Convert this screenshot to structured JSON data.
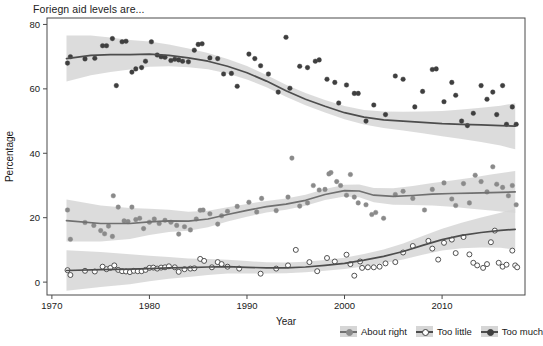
{
  "chart_data": {
    "type": "scatter",
    "title": "Foriegn aid levels are...",
    "xlabel": "Year",
    "ylabel": "Percentage",
    "xlim": [
      1969.5,
      2018.5
    ],
    "ylim": [
      -4,
      82
    ],
    "xticks": [
      1970,
      1980,
      1990,
      2000,
      2010
    ],
    "yticks": [
      0,
      20,
      40,
      60,
      80
    ],
    "grid": false,
    "legend_position": "bottom-right",
    "smoother": "loess with shaded confidence ribbon",
    "colors": {
      "too_much_line": "#4d4d4d",
      "too_much_point": "#3f3f3f",
      "about_right_line": "#707070",
      "about_right_point": "#8a8a8a",
      "too_little_line": "#4d4d4d",
      "too_little_point": "#ffffff",
      "too_little_point_edge": "#3f3f3f",
      "ribbon": "#d6d6d6",
      "axis": "#4a4a4a",
      "background": "#ffffff"
    },
    "series": [
      {
        "name": "About right",
        "marker": "filled-circle-grey",
        "points": [
          [
            1971.6,
            22.4
          ],
          [
            1971.9,
            13.3
          ],
          [
            1973.4,
            18.5
          ],
          [
            1974.3,
            17.6
          ],
          [
            1975.0,
            16.0
          ],
          [
            1975.4,
            15.0
          ],
          [
            1975.8,
            17.4
          ],
          [
            1976.2,
            14.2
          ],
          [
            1976.3,
            26.8
          ],
          [
            1976.8,
            23.3
          ],
          [
            1977.4,
            19.0
          ],
          [
            1977.8,
            18.8
          ],
          [
            1978.2,
            23.3
          ],
          [
            1978.6,
            19.4
          ],
          [
            1979.0,
            19.8
          ],
          [
            1979.4,
            16.6
          ],
          [
            1980.0,
            18.6
          ],
          [
            1980.5,
            19.6
          ],
          [
            1981.0,
            18.2
          ],
          [
            1981.6,
            19.2
          ],
          [
            1982.2,
            18.6
          ],
          [
            1982.8,
            17.6
          ],
          [
            1983.0,
            14.9
          ],
          [
            1983.6,
            17.2
          ],
          [
            1984.2,
            16.2
          ],
          [
            1984.8,
            19.6
          ],
          [
            1985.2,
            22.3
          ],
          [
            1985.5,
            22.4
          ],
          [
            1986.2,
            21.2
          ],
          [
            1987.0,
            18.0
          ],
          [
            1987.4,
            20.6
          ],
          [
            1988.0,
            22.0
          ],
          [
            1989.0,
            23.5
          ],
          [
            1990.2,
            24.8
          ],
          [
            1991.0,
            21.8
          ],
          [
            1991.5,
            26.0
          ],
          [
            1993.0,
            22.2
          ],
          [
            1994.2,
            26.4
          ],
          [
            1994.6,
            38.5
          ],
          [
            1995.4,
            23.6
          ],
          [
            1996.2,
            24.6
          ],
          [
            1996.8,
            30.0
          ],
          [
            1997.4,
            28.6
          ],
          [
            1998.0,
            28.8
          ],
          [
            1998.4,
            33.6
          ],
          [
            1998.6,
            34.0
          ],
          [
            1999.2,
            31.2
          ],
          [
            1999.6,
            30.0
          ],
          [
            2000.2,
            27.0
          ],
          [
            2000.6,
            33.4
          ],
          [
            2001.0,
            26.4
          ],
          [
            2001.4,
            24.6
          ],
          [
            2002.2,
            24.0
          ],
          [
            2002.8,
            21.0
          ],
          [
            2003.2,
            21.6
          ],
          [
            2004.0,
            19.8
          ],
          [
            2005.2,
            27.2
          ],
          [
            2006.0,
            28.2
          ],
          [
            2007.0,
            26.0
          ],
          [
            2008.2,
            22.4
          ],
          [
            2009.0,
            28.8
          ],
          [
            2010.2,
            30.8
          ],
          [
            2011.0,
            25.8
          ],
          [
            2011.4,
            23.8
          ],
          [
            2012.2,
            30.6
          ],
          [
            2012.8,
            24.6
          ],
          [
            2013.4,
            33.2
          ],
          [
            2014.0,
            31.2
          ],
          [
            2014.6,
            28.0
          ],
          [
            2015.2,
            35.8
          ],
          [
            2015.6,
            30.4
          ],
          [
            2016.2,
            29.4
          ],
          [
            2016.8,
            26.8
          ],
          [
            2017.2,
            30.0
          ],
          [
            2017.6,
            24.0
          ]
        ],
        "fit": [
          [
            1971.5,
            19.1
          ],
          [
            1975,
            18.2
          ],
          [
            1978,
            18.2
          ],
          [
            1980,
            18.7
          ],
          [
            1982,
            19.0
          ],
          [
            1984,
            18.9
          ],
          [
            1986,
            19.6
          ],
          [
            1988,
            21.0
          ],
          [
            1990,
            22.3
          ],
          [
            1992,
            23.4
          ],
          [
            1994,
            24.2
          ],
          [
            1996,
            25.4
          ],
          [
            1998,
            27.2
          ],
          [
            2000,
            28.4
          ],
          [
            2001.5,
            28.3
          ],
          [
            2003,
            27.0
          ],
          [
            2005,
            26.6
          ],
          [
            2007,
            26.9
          ],
          [
            2009,
            27.3
          ],
          [
            2011,
            27.5
          ],
          [
            2013,
            27.6
          ],
          [
            2015,
            27.8
          ],
          [
            2017.5,
            28.0
          ]
        ]
      },
      {
        "name": "Too little",
        "marker": "open-circle",
        "points": [
          [
            1971.6,
            3.7
          ],
          [
            1971.9,
            2.2
          ],
          [
            1973.4,
            3.5
          ],
          [
            1974.4,
            3.3
          ],
          [
            1975.2,
            4.8
          ],
          [
            1975.6,
            4.0
          ],
          [
            1976.0,
            4.4
          ],
          [
            1976.4,
            5.2
          ],
          [
            1976.8,
            3.8
          ],
          [
            1977.2,
            3.4
          ],
          [
            1977.6,
            3.3
          ],
          [
            1978.0,
            3.1
          ],
          [
            1978.4,
            3.5
          ],
          [
            1978.8,
            3.4
          ],
          [
            1979.2,
            3.4
          ],
          [
            1979.6,
            3.8
          ],
          [
            1980.0,
            4.4
          ],
          [
            1980.4,
            4.5
          ],
          [
            1980.8,
            4.2
          ],
          [
            1981.2,
            4.5
          ],
          [
            1981.6,
            4.6
          ],
          [
            1982.0,
            4.9
          ],
          [
            1982.6,
            4.6
          ],
          [
            1983.0,
            3.2
          ],
          [
            1983.6,
            4.0
          ],
          [
            1984.2,
            4.2
          ],
          [
            1984.6,
            4.3
          ],
          [
            1985.2,
            7.2
          ],
          [
            1985.6,
            6.6
          ],
          [
            1986.4,
            4.6
          ],
          [
            1987.0,
            6.2
          ],
          [
            1987.4,
            5.6
          ],
          [
            1988.0,
            4.8
          ],
          [
            1989.2,
            4.2
          ],
          [
            1991.4,
            2.6
          ],
          [
            1993.0,
            4.2
          ],
          [
            1994.2,
            5.2
          ],
          [
            1995.0,
            10.0
          ],
          [
            1996.4,
            6.2
          ],
          [
            1997.2,
            3.4
          ],
          [
            1998.2,
            7.5
          ],
          [
            1999.0,
            6.4
          ],
          [
            2000.2,
            8.5
          ],
          [
            2000.6,
            5.6
          ],
          [
            2001.0,
            2.0
          ],
          [
            2001.6,
            6.4
          ],
          [
            2001.8,
            4.4
          ],
          [
            2002.4,
            4.6
          ],
          [
            2003.0,
            4.6
          ],
          [
            2003.6,
            4.8
          ],
          [
            2004.2,
            5.8
          ],
          [
            2005.2,
            6.2
          ],
          [
            2006.0,
            9.2
          ],
          [
            2007.0,
            11.2
          ],
          [
            2008.6,
            12.8
          ],
          [
            2009.0,
            10.4
          ],
          [
            2009.6,
            7.0
          ],
          [
            2010.2,
            12.2
          ],
          [
            2011.0,
            13.2
          ],
          [
            2011.4,
            9.0
          ],
          [
            2012.2,
            14.0
          ],
          [
            2012.8,
            8.6
          ],
          [
            2013.2,
            6.0
          ],
          [
            2013.6,
            5.2
          ],
          [
            2014.2,
            4.4
          ],
          [
            2014.6,
            5.6
          ],
          [
            2015.0,
            12.4
          ],
          [
            2015.4,
            16.0
          ],
          [
            2015.8,
            6.0
          ],
          [
            2016.2,
            4.8
          ],
          [
            2016.6,
            5.4
          ],
          [
            2017.2,
            9.8
          ],
          [
            2017.5,
            5.2
          ],
          [
            2017.7,
            4.6
          ]
        ],
        "fit": [
          [
            1971.5,
            3.6
          ],
          [
            1975,
            3.9
          ],
          [
            1978,
            4.0
          ],
          [
            1980,
            4.2
          ],
          [
            1982,
            4.4
          ],
          [
            1984,
            4.5
          ],
          [
            1986,
            4.7
          ],
          [
            1988,
            4.8
          ],
          [
            1990,
            4.6
          ],
          [
            1992,
            4.4
          ],
          [
            1994,
            4.4
          ],
          [
            1996,
            4.7
          ],
          [
            1998,
            5.2
          ],
          [
            2000,
            5.8
          ],
          [
            2002,
            6.8
          ],
          [
            2004,
            8.0
          ],
          [
            2006,
            9.5
          ],
          [
            2008,
            11.4
          ],
          [
            2010,
            13.2
          ],
          [
            2012,
            14.5
          ],
          [
            2014,
            15.4
          ],
          [
            2016,
            16.1
          ],
          [
            2017.5,
            16.4
          ]
        ]
      },
      {
        "name": "Too much",
        "marker": "filled-circle-dark",
        "points": [
          [
            1971.6,
            68.0
          ],
          [
            1971.9,
            70.0
          ],
          [
            1973.4,
            69.3
          ],
          [
            1974.4,
            69.5
          ],
          [
            1975.2,
            73.4
          ],
          [
            1975.6,
            73.4
          ],
          [
            1976.2,
            75.6
          ],
          [
            1976.6,
            61.0
          ],
          [
            1977.2,
            74.6
          ],
          [
            1977.6,
            74.8
          ],
          [
            1978.2,
            65.2
          ],
          [
            1978.6,
            66.2
          ],
          [
            1979.2,
            66.6
          ],
          [
            1979.6,
            68.6
          ],
          [
            1980.2,
            74.6
          ],
          [
            1980.8,
            70.5
          ],
          [
            1981.2,
            70.0
          ],
          [
            1981.6,
            69.8
          ],
          [
            1982.2,
            68.8
          ],
          [
            1982.6,
            69.2
          ],
          [
            1983.0,
            69.0
          ],
          [
            1983.4,
            68.6
          ],
          [
            1984.0,
            68.4
          ],
          [
            1984.6,
            72.0
          ],
          [
            1985.0,
            73.8
          ],
          [
            1985.4,
            74.0
          ],
          [
            1986.2,
            69.6
          ],
          [
            1987.0,
            69.4
          ],
          [
            1987.6,
            64.6
          ],
          [
            1988.4,
            64.8
          ],
          [
            1989.0,
            60.8
          ],
          [
            1990.2,
            70.8
          ],
          [
            1990.8,
            69.4
          ],
          [
            1991.4,
            67.2
          ],
          [
            1992.2,
            64.6
          ],
          [
            1993.2,
            59.0
          ],
          [
            1994.0,
            76.0
          ],
          [
            1994.4,
            60.2
          ],
          [
            1995.4,
            67.0
          ],
          [
            1996.2,
            66.6
          ],
          [
            1997.0,
            68.6
          ],
          [
            1997.4,
            69.0
          ],
          [
            1998.2,
            63.0
          ],
          [
            1999.0,
            62.0
          ],
          [
            1999.4,
            55.6
          ],
          [
            2000.2,
            61.2
          ],
          [
            2001.0,
            58.6
          ],
          [
            2001.4,
            58.6
          ],
          [
            2002.2,
            50.0
          ],
          [
            2003.0,
            55.0
          ],
          [
            2004.2,
            52.0
          ],
          [
            2005.2,
            64.0
          ],
          [
            2006.0,
            63.0
          ],
          [
            2007.2,
            54.4
          ],
          [
            2008.0,
            59.2
          ],
          [
            2009.0,
            66.0
          ],
          [
            2009.4,
            66.2
          ],
          [
            2010.2,
            56.0
          ],
          [
            2011.0,
            62.0
          ],
          [
            2011.4,
            58.0
          ],
          [
            2012.0,
            50.0
          ],
          [
            2012.6,
            48.6
          ],
          [
            2013.2,
            52.4
          ],
          [
            2014.0,
            61.0
          ],
          [
            2014.6,
            56.8
          ],
          [
            2015.2,
            59.0
          ],
          [
            2015.6,
            52.0
          ],
          [
            2016.2,
            61.0
          ],
          [
            2016.6,
            49.0
          ],
          [
            2017.2,
            54.4
          ],
          [
            2017.6,
            49.0
          ]
        ],
        "fit": [
          [
            1971.5,
            69.4
          ],
          [
            1974,
            70.4
          ],
          [
            1976,
            70.6
          ],
          [
            1978,
            70.6
          ],
          [
            1980,
            70.8
          ],
          [
            1982,
            70.4
          ],
          [
            1984,
            69.6
          ],
          [
            1986,
            68.6
          ],
          [
            1988,
            67.0
          ],
          [
            1990,
            65.0
          ],
          [
            1992,
            62.4
          ],
          [
            1994,
            59.4
          ],
          [
            1996,
            56.8
          ],
          [
            1998,
            54.6
          ],
          [
            2000,
            52.6
          ],
          [
            2002,
            51.2
          ],
          [
            2004,
            50.4
          ],
          [
            2006,
            50.0
          ],
          [
            2008,
            49.6
          ],
          [
            2010,
            49.2
          ],
          [
            2012,
            49.0
          ],
          [
            2014,
            48.8
          ],
          [
            2016,
            48.6
          ],
          [
            2017.5,
            48.4
          ]
        ]
      }
    ]
  }
}
